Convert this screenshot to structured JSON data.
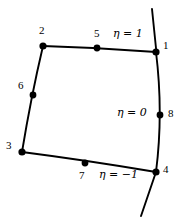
{
  "figure": {
    "type": "diagram",
    "background_color": "#ffffff",
    "stroke_color": "#000000",
    "nodes": [
      {
        "id": "1",
        "label": "1",
        "x": 156,
        "y": 52,
        "label_x": 163,
        "label_y": 45
      },
      {
        "id": "2",
        "label": "2",
        "x": 43,
        "y": 46,
        "label_x": 39,
        "label_y": 28
      },
      {
        "id": "3",
        "label": "3",
        "x": 22,
        "y": 152,
        "label_x": 6,
        "label_y": 144
      },
      {
        "id": "4",
        "label": "4",
        "x": 156,
        "y": 172,
        "label_x": 163,
        "label_y": 168
      },
      {
        "id": "5",
        "label": "5",
        "x": 97,
        "y": 48,
        "label_x": 94,
        "label_y": 31
      },
      {
        "id": "6",
        "label": "6",
        "x": 33,
        "y": 95,
        "label_x": 18,
        "label_y": 83
      },
      {
        "id": "7",
        "label": "7",
        "x": 85,
        "y": 163,
        "label_x": 79,
        "label_y": 172
      },
      {
        "id": "8",
        "label": "8",
        "x": 160,
        "y": 115,
        "label_x": 168,
        "label_y": 110
      }
    ],
    "eta_labels": [
      {
        "id": "eta-top",
        "symbol": "η",
        "relation": "=",
        "value": "1",
        "text": "η = 1",
        "x": 114,
        "y": 32
      },
      {
        "id": "eta-mid",
        "symbol": "η",
        "relation": "=",
        "value": "0",
        "text": "η = 0",
        "x": 117,
        "y": 110
      },
      {
        "id": "eta-bottom",
        "symbol": "η",
        "relation": "=",
        "value": "−1",
        "text": "η = −1",
        "x": 100,
        "y": 172
      }
    ],
    "edges": [
      {
        "id": "edge-top",
        "from": "2",
        "to": "1",
        "via_node": "5",
        "curved": true
      },
      {
        "id": "edge-left",
        "from": "2",
        "to": "3",
        "via_node": "6",
        "curved": true
      },
      {
        "id": "edge-bottom",
        "from": "3",
        "to": "4",
        "via_node": "7",
        "curved": true
      },
      {
        "id": "edge-right",
        "from": "1",
        "to": "4",
        "via_node": "8",
        "curved": true
      }
    ],
    "curve_extensions": [
      {
        "id": "curve-top-extension",
        "from_node": "1",
        "to_x": 152,
        "to_y": 9
      },
      {
        "id": "curve-bottom-extension",
        "from_node": "4",
        "to_x": 141,
        "to_y": 216
      }
    ]
  }
}
